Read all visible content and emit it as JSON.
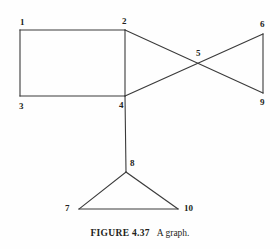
{
  "figure": {
    "caption_label": "FIGURE  4.37",
    "caption_text": "A graph.",
    "line_color": "#3a3a3a",
    "background_color": "#fefefe",
    "text_color": "#231f20"
  },
  "graph": {
    "nodes": [
      {
        "id": "1",
        "label": "1",
        "x": 20,
        "y": 30,
        "label_x": 20,
        "label_y": 17
      },
      {
        "id": "2",
        "label": "2",
        "x": 125,
        "y": 30,
        "label_x": 122,
        "label_y": 16
      },
      {
        "id": "3",
        "label": "3",
        "x": 20,
        "y": 96,
        "label_x": 19,
        "label_y": 101
      },
      {
        "id": "4",
        "label": "4",
        "x": 125,
        "y": 96,
        "label_x": 119,
        "label_y": 100
      },
      {
        "id": "5",
        "label": "5",
        "x": 201,
        "y": 64,
        "label_x": 196,
        "label_y": 48
      },
      {
        "id": "6",
        "label": "6",
        "x": 263,
        "y": 34,
        "label_x": 260,
        "label_y": 19
      },
      {
        "id": "7",
        "label": "7",
        "x": 79,
        "y": 209,
        "label_x": 65,
        "label_y": 203
      },
      {
        "id": "8",
        "label": "8",
        "x": 126,
        "y": 172,
        "label_x": 130,
        "label_y": 158
      },
      {
        "id": "9",
        "label": "9",
        "x": 263,
        "y": 93,
        "label_x": 260,
        "label_y": 97
      },
      {
        "id": "10",
        "label": "10",
        "x": 178,
        "y": 209,
        "label_x": 184,
        "label_y": 203
      }
    ],
    "edges": [
      {
        "from": "1",
        "to": "2"
      },
      {
        "from": "1",
        "to": "3"
      },
      {
        "from": "3",
        "to": "4"
      },
      {
        "from": "2",
        "to": "4"
      },
      {
        "from": "2",
        "to": "9"
      },
      {
        "from": "4",
        "to": "6"
      },
      {
        "from": "6",
        "to": "9"
      },
      {
        "from": "4",
        "to": "8"
      },
      {
        "from": "8",
        "to": "7"
      },
      {
        "from": "8",
        "to": "10"
      },
      {
        "from": "7",
        "to": "10"
      }
    ]
  }
}
